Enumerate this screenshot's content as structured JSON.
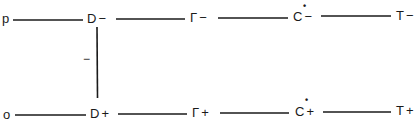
{
  "diagram": {
    "type": "state-chain",
    "rows": [
      {
        "id": "top",
        "start_label": "p",
        "nodes": [
          {
            "symbol": "D",
            "sign": "−",
            "marked": false
          },
          {
            "symbol": "Γ",
            "sign": "−",
            "marked": false
          },
          {
            "symbol": "C",
            "sign": "−",
            "marked": true,
            "mark": "•"
          },
          {
            "symbol": "T",
            "sign": "−",
            "marked": false
          }
        ]
      },
      {
        "id": "bottom",
        "start_label": "o",
        "nodes": [
          {
            "symbol": "D",
            "sign": "+",
            "marked": false
          },
          {
            "symbol": "Γ",
            "sign": "+",
            "marked": false
          },
          {
            "symbol": "C",
            "sign": "+",
            "marked": true,
            "mark": "•"
          },
          {
            "symbol": "T",
            "sign": "+",
            "marked": false
          }
        ]
      }
    ],
    "vertical_link": {
      "from": "D−",
      "to": "D+",
      "label": "−"
    },
    "colors": {
      "line": "#1a1a1a",
      "background": "#ffffff"
    }
  }
}
